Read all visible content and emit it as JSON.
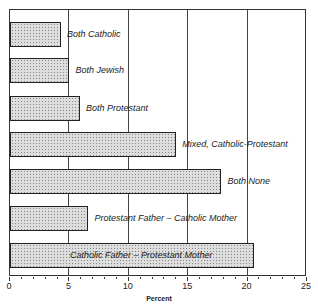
{
  "chart_data": {
    "type": "bar",
    "orientation": "horizontal",
    "title": "",
    "xlabel": "Percent",
    "ylabel": "",
    "xlim": [
      0,
      25
    ],
    "xticks": [
      0,
      5,
      10,
      15,
      20,
      25
    ],
    "grid": "vertical at major ticks",
    "categories": [
      "Both Catholic",
      "Both Jewish",
      "Both Protestant",
      "Mixed, Catholic-Protestant",
      "Both None",
      "Protestant Father - Catholic Mother",
      "Catholic Father - Protestant Mother"
    ],
    "values": [
      4.3,
      5.0,
      5.9,
      14.0,
      17.8,
      6.6,
      20.5
    ]
  },
  "axis": {
    "xlabel": "Percent",
    "ticks": [
      "0",
      "5",
      "10",
      "15",
      "20",
      "25"
    ]
  }
}
